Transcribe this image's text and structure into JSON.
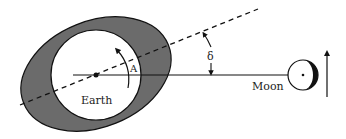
{
  "diagram": {
    "labels": {
      "earth": "Earth",
      "moon": "Moon",
      "angle_a": "A",
      "angle_delta": "δ"
    },
    "colors": {
      "tidal_bulge": "#6b6b6b",
      "earth_fill": "#ffffff",
      "moon_shadow": "#111111",
      "line": "#111111"
    }
  }
}
